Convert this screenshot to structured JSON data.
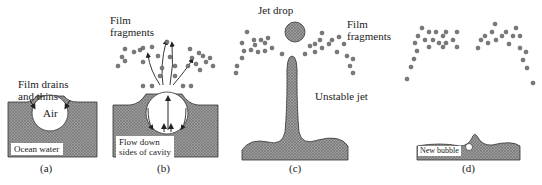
{
  "panels": [
    {
      "id": "a",
      "caption": "(a)",
      "labels": {
        "top_line1": "Film drains",
        "top_line2": "and thins",
        "bubble": "Air",
        "water": "Ocean water"
      }
    },
    {
      "id": "b",
      "caption": "(b)",
      "labels": {
        "top_line1": "Film",
        "top_line2": "fragments",
        "flow_line1": "Flow down",
        "flow_line2": "sides of cavity"
      }
    },
    {
      "id": "c",
      "caption": "(c)",
      "labels": {
        "jet_drop": "Jet drop",
        "film_line1": "Film",
        "film_line2": "fragments",
        "jet": "Unstable jet"
      }
    },
    {
      "id": "d",
      "caption": "(d)",
      "labels": {
        "new_bubble": "New bubble"
      }
    }
  ],
  "colors": {
    "water_fill": "#8a8a8a",
    "outline": "#333333",
    "droplet": "#7a7a7a"
  }
}
